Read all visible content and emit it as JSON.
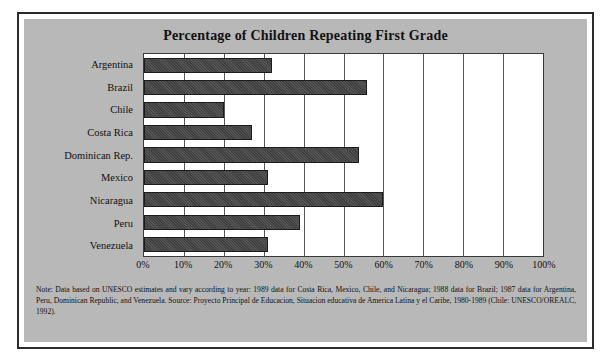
{
  "chart_data": {
    "type": "bar",
    "orientation": "horizontal",
    "title": "Percentage of Children Repeating First Grade",
    "xlabel": "",
    "ylabel": "",
    "xlim": [
      0,
      100
    ],
    "grid": true,
    "legend": "none",
    "categories": [
      "Argentina",
      "Brazil",
      "Chile",
      "Costa Rica",
      "Dominican Rep.",
      "Mexico",
      "Nicaragua",
      "Peru",
      "Venezuela"
    ],
    "values": [
      32,
      56,
      20,
      27,
      54,
      31,
      60,
      39,
      31
    ],
    "xticks": [
      0,
      10,
      20,
      30,
      40,
      50,
      60,
      70,
      80,
      90,
      100
    ],
    "xticklabels": [
      "0%",
      "10%",
      "20%",
      "30%",
      "40%",
      "50%",
      "60%",
      "70%",
      "80%",
      "90%",
      "100%"
    ],
    "bar_color": "#484848",
    "plot_background": "#ffffff",
    "panel_background": "#b8b8b8"
  },
  "footnote": {
    "text": "Note: Data based on UNESCO estimates and vary according to year: 1989 data for Costa Rica, Mexico, Chile, and Nicaragua; 1988 data for Brazil; 1987 data for Argentina, Peru, Dominican Republic, and Venezuela. Source: Proyecto Principal de Educacion, Situacion educativa de America Latina y el Caribe, 1980-1989 (Chile: UNESCO/OREALC, 1992)."
  }
}
